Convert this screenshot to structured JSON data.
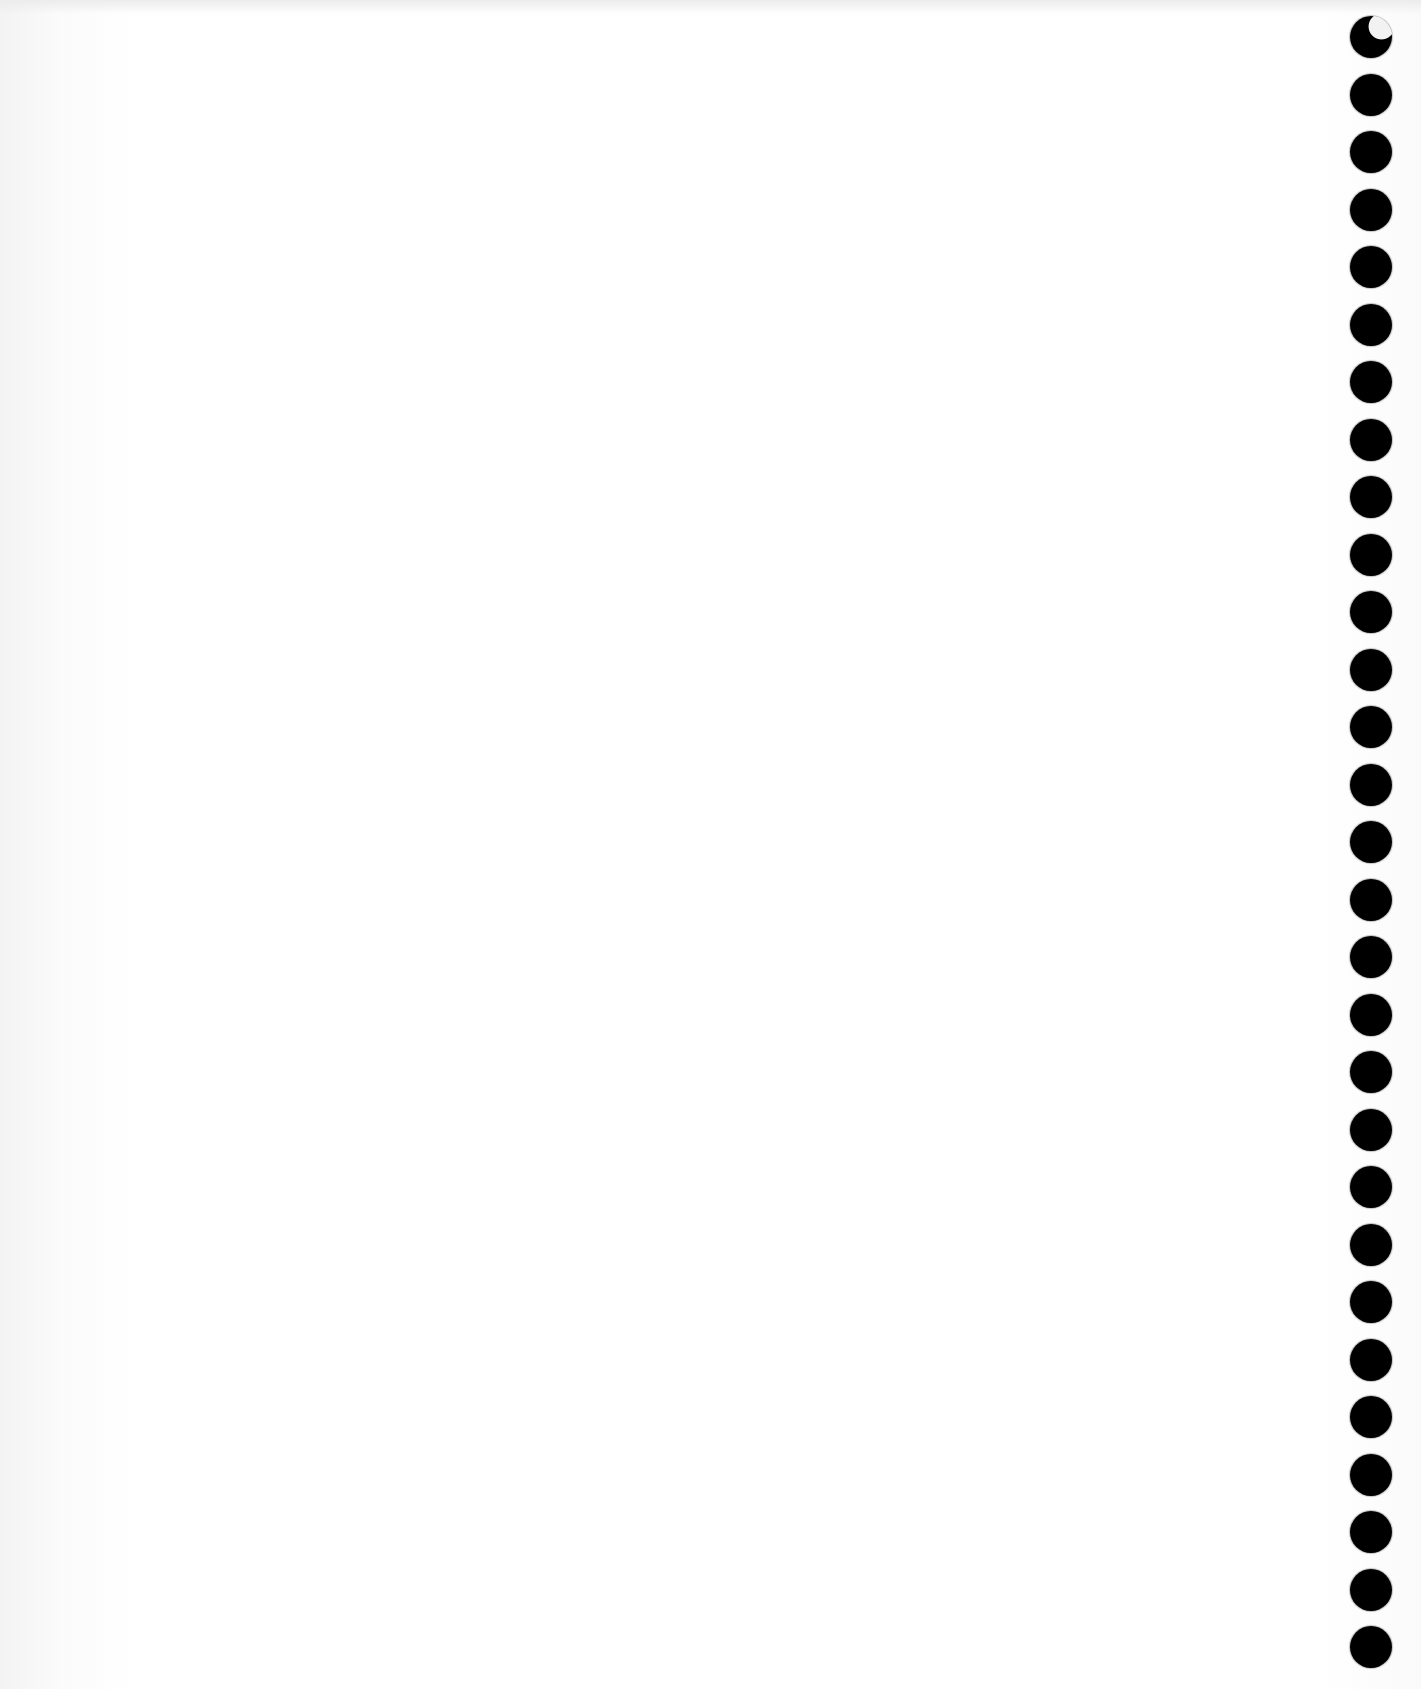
{
  "page": {
    "type": "blank-scanned-sheet",
    "background_color": "#ffffff",
    "content_text": ""
  },
  "punch_holes": {
    "count": 29,
    "color": "#000000",
    "diameter_px": 42,
    "x_px": 1350,
    "first_y_px": 16,
    "spacing_px": 57.5,
    "position": "right-edge"
  }
}
